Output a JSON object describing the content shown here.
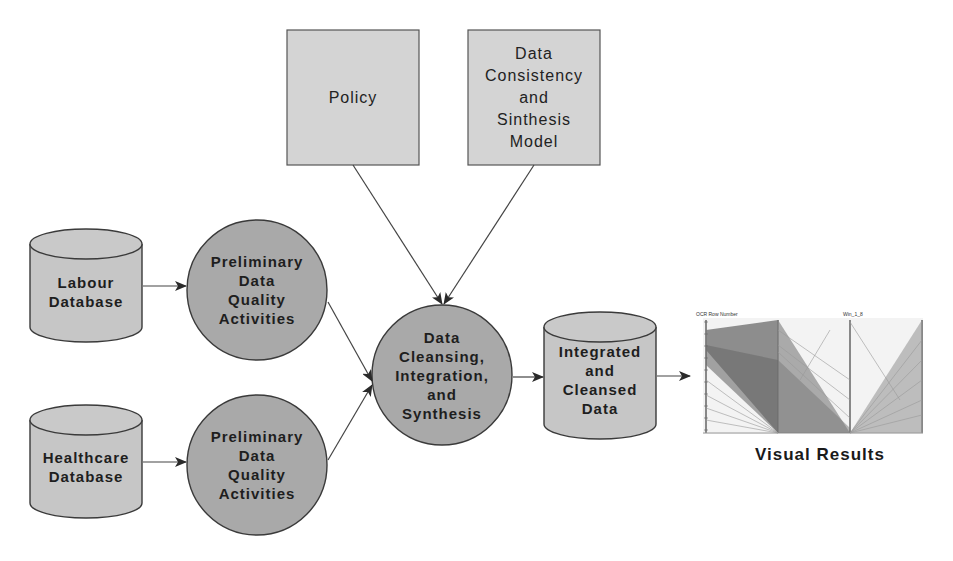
{
  "diagram": {
    "type": "data-flow",
    "colors": {
      "box_fill": "#d4d4d4",
      "circle_fill": "#a9a9a9",
      "cylinder_fill": "#c6c6c6",
      "stroke": "#3a3a3a",
      "arrow": "#2a2a2a"
    },
    "nodes": {
      "policy": {
        "label": "Policy",
        "shape": "rectangle"
      },
      "model": {
        "label": "Data\nConsistency\nand\nSinthesis\nModel",
        "shape": "rectangle"
      },
      "labour_db": {
        "label": "Labour\nDatabase",
        "shape": "cylinder"
      },
      "healthcare_db": {
        "label": "Healthcare\nDatabase",
        "shape": "cylinder"
      },
      "prelim_1": {
        "label": "Preliminary\nData\nQuality\nActivities",
        "shape": "circle"
      },
      "prelim_2": {
        "label": "Preliminary\nData\nQuality\nActivities",
        "shape": "circle"
      },
      "cleansing": {
        "label": "Data\nCleansing,\nIntegration,\nand\nSynthesis",
        "shape": "circle"
      },
      "integrated_db": {
        "label": "Integrated\nand\nCleansed\nData",
        "shape": "cylinder"
      },
      "visual_results": {
        "label": "Visual Results",
        "shape": "image"
      }
    },
    "edges": [
      {
        "from": "labour_db",
        "to": "prelim_1"
      },
      {
        "from": "healthcare_db",
        "to": "prelim_2"
      },
      {
        "from": "prelim_1",
        "to": "cleansing"
      },
      {
        "from": "prelim_2",
        "to": "cleansing"
      },
      {
        "from": "policy",
        "to": "cleansing"
      },
      {
        "from": "model",
        "to": "cleansing"
      },
      {
        "from": "cleansing",
        "to": "integrated_db"
      },
      {
        "from": "integrated_db",
        "to": "visual_results"
      }
    ],
    "visual_results_chart": {
      "type": "parallel-coordinates",
      "axis_titles": [
        "OCR Row Number",
        "",
        "Win_1_8",
        ""
      ],
      "axis1_ticks": [
        "10",
        "9",
        "8",
        "7",
        "6",
        "5",
        "4",
        "3",
        "2",
        "1"
      ]
    }
  }
}
